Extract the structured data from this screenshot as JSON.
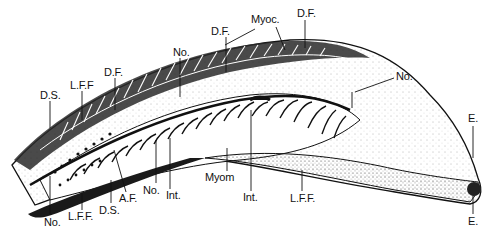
{
  "figure": {
    "type": "anatomical-illustration",
    "colors": {
      "ink": "#111111",
      "background": "#ffffff",
      "stipple": "#555555"
    },
    "labels": [
      {
        "id": "ds-top",
        "text": "D.S.",
        "x": 40,
        "y": 90
      },
      {
        "id": "lff-top",
        "text": "L.F.F",
        "x": 70,
        "y": 80
      },
      {
        "id": "df-left",
        "text": "D.F.",
        "x": 104,
        "y": 67
      },
      {
        "id": "no-top",
        "text": "No.",
        "x": 173,
        "y": 47
      },
      {
        "id": "df-mid",
        "text": "D.F.",
        "x": 211,
        "y": 26
      },
      {
        "id": "myoc",
        "text": "Myoc.",
        "x": 251,
        "y": 14
      },
      {
        "id": "df-right",
        "text": "D.F.",
        "x": 297,
        "y": 8
      },
      {
        "id": "no-right",
        "text": "No.",
        "x": 396,
        "y": 71
      },
      {
        "id": "e-top",
        "text": "E.",
        "x": 470,
        "y": 113
      },
      {
        "id": "e-bottom",
        "text": "E.",
        "x": 470,
        "y": 216
      },
      {
        "id": "no-bottom-left",
        "text": "No.",
        "x": 44,
        "y": 217
      },
      {
        "id": "lff-bottom-left",
        "text": "L.F.F.",
        "x": 68,
        "y": 211
      },
      {
        "id": "ds-bottom",
        "text": "D.S.",
        "x": 99,
        "y": 205
      },
      {
        "id": "af",
        "text": "A.F.",
        "x": 119,
        "y": 193
      },
      {
        "id": "no-bottom-mid",
        "text": "No.",
        "x": 143,
        "y": 185
      },
      {
        "id": "int-left",
        "text": "Int.",
        "x": 166,
        "y": 190
      },
      {
        "id": "myom",
        "text": "Myom",
        "x": 205,
        "y": 172
      },
      {
        "id": "int-right",
        "text": "Int.",
        "x": 243,
        "y": 192
      },
      {
        "id": "lff-bottom-right",
        "text": "L.F.F.",
        "x": 290,
        "y": 193
      }
    ]
  }
}
